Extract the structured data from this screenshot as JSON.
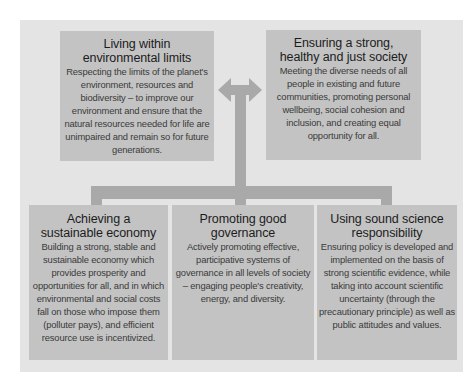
{
  "diagram": {
    "colors": {
      "panel_background": "#e4e4e4",
      "box_background": "#c3c3c3",
      "connector": "#a9a9a9"
    },
    "top_boxes": [
      {
        "title_line1": "Living within",
        "title_line2": "environmental limits",
        "description": "Respecting the limits of the planet's environment, resources and biodiversity – to improve our environment and ensure that the natural resources needed for life are unimpaired and remain so for future generations."
      },
      {
        "title_line1": "Ensuring a strong,",
        "title_line2": "healthy and just society",
        "description": "Meeting the diverse needs of all people in existing and future communities, promoting personal wellbeing, social cohesion and inclusion, and creating equal opportunity for all."
      }
    ],
    "bottom_boxes": [
      {
        "title_line1": "Achieving a",
        "title_line2": "sustainable economy",
        "description": "Building a strong, stable and sustainable economy which provides prosperity and opportunities for all, and in which environmental and social costs fall on those who impose them (polluter pays), and efficient resource use is incentivized."
      },
      {
        "title_line1": "Promoting good",
        "title_line2": "governance",
        "description": "Actively promoting effective, participative systems of governance in all levels of society – engaging people's creativity, energy, and diversity."
      },
      {
        "title_line1": "Using sound science",
        "title_line2": "responsibility",
        "description": "Ensuring policy is developed and implemented on the basis of strong scientific evidence, while taking into account scientific uncertainty (through the precautionary principle) as well as public attitudes and values."
      }
    ],
    "connectors": {
      "top": "double-headed-arrow-left-right",
      "stem": "vertical-stem",
      "bottom": "horizontal-bar-with-three-drops"
    }
  }
}
